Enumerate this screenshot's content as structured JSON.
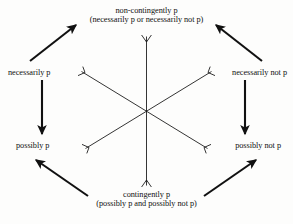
{
  "diagram": {
    "type": "modal-logic-hexagon",
    "title": "",
    "ink_color": "#111111",
    "background_color": "#fdfdfc",
    "nodes": [
      {
        "id": "non-contingently-p",
        "line1": "non-contingently p",
        "line2": "(necessarily p or necessarily not p)",
        "position": "top"
      },
      {
        "id": "necessarily-p",
        "line1": "necessarily p",
        "line2": "",
        "position": "upper-left"
      },
      {
        "id": "necessarily-not-p",
        "line1": "necessarily not p",
        "line2": "",
        "position": "upper-right"
      },
      {
        "id": "possibly-p",
        "line1": "possibly p",
        "line2": "",
        "position": "lower-left"
      },
      {
        "id": "possibly-not-p",
        "line1": "possibly not p",
        "line2": "",
        "position": "lower-right"
      },
      {
        "id": "contingently-p",
        "line1": "contingently p",
        "line2": "(possibly p and possibly not p)",
        "position": "bottom"
      }
    ],
    "arrows": [
      {
        "id": "nec-p-to-non-contingently-p",
        "from": "necessarily-p",
        "to": "non-contingently-p",
        "style": "thick-filled-head"
      },
      {
        "id": "nec-not-p-to-non-contingently-p",
        "from": "necessarily-not-p",
        "to": "non-contingently-p",
        "style": "thick-filled-head"
      },
      {
        "id": "nec-p-to-poss-p",
        "from": "necessarily-p",
        "to": "possibly-p",
        "style": "thick-filled-head"
      },
      {
        "id": "nec-not-p-to-poss-not-p",
        "from": "necessarily-not-p",
        "to": "possibly-not-p",
        "style": "thick-filled-head"
      },
      {
        "id": "contingently-p-to-poss-p",
        "from": "contingently-p",
        "to": "possibly-p",
        "style": "thick-filled-head"
      },
      {
        "id": "contingently-p-to-poss-not-p",
        "from": "contingently-p",
        "to": "possibly-not-p",
        "style": "thick-filled-head"
      }
    ],
    "cross_lines": [
      {
        "id": "vertical-line",
        "orientation": "vertical",
        "terminals": "forked"
      },
      {
        "id": "diagonal-line-nw-se",
        "orientation": "diagonal-nw-se",
        "terminals": "forked"
      },
      {
        "id": "diagonal-line-ne-sw",
        "orientation": "diagonal-ne-sw",
        "terminals": "forked"
      }
    ]
  }
}
